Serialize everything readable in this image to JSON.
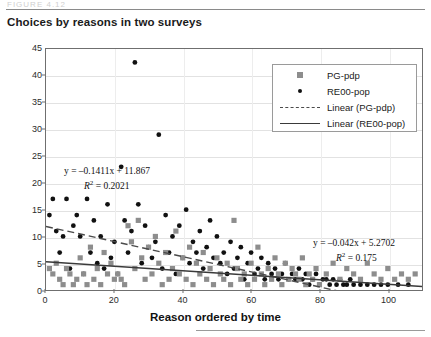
{
  "page": {
    "header_ghost_text": "FIGURE 4.12",
    "figure_title": "Choices by reasons in two surveys"
  },
  "legend": {
    "items": [
      {
        "key": "square-marker",
        "label": "PG-pdp"
      },
      {
        "key": "dot-marker",
        "label": "RE00-pop"
      },
      {
        "key": "dashed-line",
        "label": "Linear (PG-pdp)"
      },
      {
        "key": "solid-line",
        "label": "Linear (RE00-pop)"
      }
    ]
  },
  "annotations": {
    "eq1_line1": "y = –0.1411x + 11.867",
    "eq1_line2_prefix": "R",
    "eq1_line2_sup": "2",
    "eq1_line2_value": " = 0.2021",
    "eq2_line1": "y = –0.042x + 5.2702",
    "eq2_line2_prefix": "R",
    "eq2_line2_sup": "2",
    "eq2_line2_value": " = 0.175"
  },
  "chart_data": {
    "type": "scatter",
    "title": "Choices by reasons in two surveys",
    "xlabel": "Reason ordered by time",
    "ylabel": "Votes",
    "xlim": [
      0,
      110
    ],
    "ylim": [
      0,
      45
    ],
    "xticks": [
      0,
      20,
      40,
      60,
      80,
      100
    ],
    "yticks": [
      0,
      5,
      10,
      15,
      20,
      25,
      30,
      35,
      40,
      45
    ],
    "grid": "horizontal",
    "legend_position": "top-right-inside",
    "colors": {
      "square_marker": "#8d8d8d",
      "dot_marker": "#111111",
      "dashed_trend": "#4a4a4a",
      "solid_trend": "#3a3a3a",
      "gridline": "#e2e2e2",
      "frame": "#6f6f6f"
    },
    "series": [
      {
        "name": "RE00-pop",
        "marker": "circle",
        "color": "#111111",
        "trendline": {
          "style": "dashed",
          "slope": -0.1411,
          "intercept": 11.867,
          "r2": 0.2021,
          "equation": "y = -0.1411x + 11.867"
        },
        "points": [
          [
            1,
            14
          ],
          [
            2,
            17
          ],
          [
            3,
            11
          ],
          [
            4,
            7
          ],
          [
            5,
            10
          ],
          [
            6,
            17
          ],
          [
            7,
            4
          ],
          [
            8,
            12
          ],
          [
            9,
            14
          ],
          [
            10,
            10
          ],
          [
            11,
            3
          ],
          [
            12,
            17
          ],
          [
            13,
            7
          ],
          [
            14,
            13
          ],
          [
            15,
            5
          ],
          [
            16,
            10
          ],
          [
            17,
            4
          ],
          [
            18,
            16
          ],
          [
            19,
            6
          ],
          [
            20,
            9
          ],
          [
            21,
            3
          ],
          [
            22,
            23
          ],
          [
            23,
            13
          ],
          [
            24,
            7
          ],
          [
            25,
            11
          ],
          [
            26,
            42.5
          ],
          [
            27,
            16
          ],
          [
            28,
            5
          ],
          [
            29,
            12
          ],
          [
            30,
            8
          ],
          [
            31,
            6
          ],
          [
            32,
            9
          ],
          [
            33,
            29
          ],
          [
            34,
            4
          ],
          [
            35,
            14
          ],
          [
            36,
            7
          ],
          [
            37,
            10
          ],
          [
            38,
            3
          ],
          [
            39,
            12
          ],
          [
            40,
            6
          ],
          [
            41,
            15
          ],
          [
            42,
            5
          ],
          [
            43,
            9
          ],
          [
            44,
            7
          ],
          [
            45,
            11
          ],
          [
            46,
            4
          ],
          [
            47,
            8
          ],
          [
            48,
            13
          ],
          [
            49,
            6
          ],
          [
            50,
            10
          ],
          [
            51,
            5
          ],
          [
            52,
            7
          ],
          [
            53,
            3
          ],
          [
            54,
            9
          ],
          [
            55,
            4
          ],
          [
            56,
            6
          ],
          [
            57,
            8
          ],
          [
            58,
            2
          ],
          [
            59,
            5
          ],
          [
            60,
            7
          ],
          [
            61,
            3
          ],
          [
            62,
            4
          ],
          [
            63,
            6
          ],
          [
            64,
            2
          ],
          [
            65,
            5
          ],
          [
            66,
            3
          ],
          [
            67,
            4
          ],
          [
            68,
            2
          ],
          [
            69,
            3
          ],
          [
            70,
            5
          ],
          [
            71,
            2
          ],
          [
            72,
            3
          ],
          [
            73,
            2
          ],
          [
            74,
            4
          ],
          [
            75,
            2
          ],
          [
            76,
            3
          ],
          [
            77,
            1
          ],
          [
            78,
            2
          ],
          [
            79,
            3
          ],
          [
            80,
            1
          ],
          [
            81,
            2
          ],
          [
            82,
            2
          ],
          [
            83,
            1
          ],
          [
            84,
            2
          ],
          [
            85,
            1
          ],
          [
            86,
            2
          ],
          [
            87,
            1
          ],
          [
            88,
            1
          ],
          [
            89,
            2
          ],
          [
            90,
            1
          ],
          [
            92,
            1
          ],
          [
            94,
            1
          ],
          [
            96,
            1
          ],
          [
            98,
            1
          ],
          [
            100,
            1
          ],
          [
            103,
            1
          ],
          [
            106,
            1
          ]
        ]
      },
      {
        "name": "PG-pdp",
        "marker": "square",
        "color": "#8d8d8d",
        "trendline": {
          "style": "solid",
          "slope": -0.042,
          "intercept": 5.2702,
          "r2": 0.175,
          "equation": "y = -0.042x + 5.2702"
        },
        "points": [
          [
            1,
            4
          ],
          [
            2,
            3
          ],
          [
            3,
            5
          ],
          [
            4,
            2
          ],
          [
            5,
            1
          ],
          [
            6,
            4
          ],
          [
            7,
            3
          ],
          [
            8,
            1
          ],
          [
            9,
            2
          ],
          [
            10,
            6
          ],
          [
            11,
            3
          ],
          [
            12,
            1
          ],
          [
            13,
            8
          ],
          [
            14,
            2
          ],
          [
            15,
            4
          ],
          [
            16,
            1
          ],
          [
            17,
            7
          ],
          [
            18,
            3
          ],
          [
            19,
            5
          ],
          [
            20,
            2
          ],
          [
            21,
            3
          ],
          [
            22,
            2
          ],
          [
            23,
            1
          ],
          [
            24,
            12
          ],
          [
            25,
            9
          ],
          [
            26,
            4
          ],
          [
            27,
            13
          ],
          [
            28,
            6
          ],
          [
            29,
            2
          ],
          [
            30,
            8
          ],
          [
            31,
            3
          ],
          [
            32,
            10
          ],
          [
            33,
            5
          ],
          [
            34,
            1
          ],
          [
            35,
            7
          ],
          [
            36,
            2
          ],
          [
            37,
            4
          ],
          [
            38,
            11
          ],
          [
            39,
            3
          ],
          [
            40,
            6
          ],
          [
            41,
            2
          ],
          [
            42,
            8
          ],
          [
            43,
            1
          ],
          [
            44,
            5
          ],
          [
            45,
            3
          ],
          [
            46,
            7
          ],
          [
            47,
            2
          ],
          [
            48,
            4
          ],
          [
            49,
            1
          ],
          [
            50,
            6
          ],
          [
            51,
            3
          ],
          [
            52,
            2
          ],
          [
            53,
            5
          ],
          [
            54,
            1
          ],
          [
            55,
            13
          ],
          [
            56,
            4
          ],
          [
            57,
            2
          ],
          [
            58,
            3
          ],
          [
            59,
            1
          ],
          [
            60,
            5
          ],
          [
            61,
            2
          ],
          [
            62,
            8
          ],
          [
            63,
            3
          ],
          [
            64,
            1
          ],
          [
            65,
            4
          ],
          [
            66,
            2
          ],
          [
            67,
            6
          ],
          [
            68,
            3
          ],
          [
            69,
            1
          ],
          [
            70,
            5
          ],
          [
            71,
            2
          ],
          [
            72,
            4
          ],
          [
            73,
            3
          ],
          [
            74,
            2
          ],
          [
            75,
            6
          ],
          [
            76,
            1
          ],
          [
            77,
            3
          ],
          [
            78,
            2
          ],
          [
            79,
            4
          ],
          [
            80,
            1
          ],
          [
            82,
            3
          ],
          [
            84,
            5
          ],
          [
            86,
            2
          ],
          [
            88,
            4
          ],
          [
            90,
            3
          ],
          [
            92,
            2
          ],
          [
            94,
            5
          ],
          [
            96,
            3
          ],
          [
            98,
            2
          ],
          [
            100,
            4
          ],
          [
            102,
            2
          ],
          [
            104,
            3
          ],
          [
            106,
            2
          ],
          [
            108,
            3
          ]
        ]
      }
    ]
  }
}
